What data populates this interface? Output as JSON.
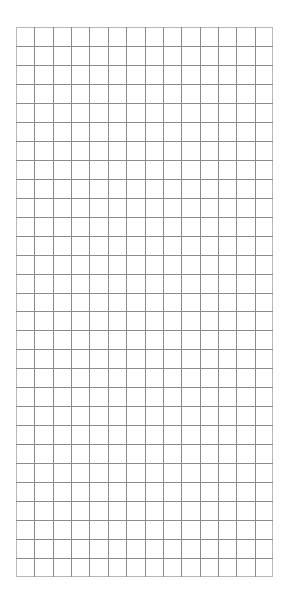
{
  "grid": {
    "columns": 14,
    "rows": 29,
    "line_color": "#8a8a8a",
    "border_color": "#b8b8b8",
    "background": "#ffffff"
  }
}
